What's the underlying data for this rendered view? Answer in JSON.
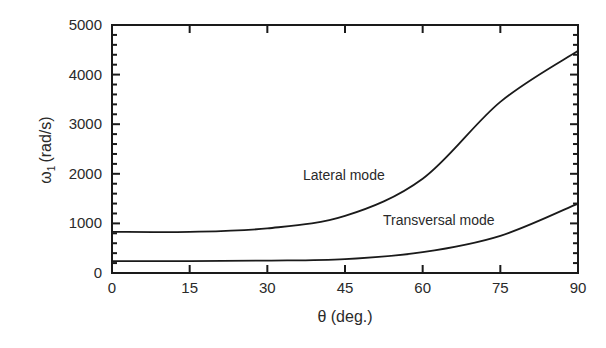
{
  "chart_data": {
    "type": "line",
    "title": "",
    "xlabel": "θ (deg.)",
    "ylabel": "ω1 (rad/s)",
    "xlim": [
      0,
      90
    ],
    "ylim": [
      0,
      5000
    ],
    "xticks": [
      0,
      15,
      30,
      45,
      60,
      75,
      90
    ],
    "yticks": [
      0,
      1000,
      2000,
      3000,
      4000,
      5000
    ],
    "grid": false,
    "legend": "none (inline annotations)",
    "x": [
      0,
      15,
      30,
      45,
      60,
      75,
      90
    ],
    "series": [
      {
        "name": "Lateral mode",
        "values": [
          830,
          830,
          900,
          1150,
          1900,
          3450,
          4480
        ]
      },
      {
        "name": "Transversal mode",
        "values": [
          240,
          240,
          250,
          280,
          420,
          750,
          1400
        ]
      }
    ],
    "annotations": [
      {
        "text": "Lateral mode",
        "x": 51,
        "y": 1920
      },
      {
        "text": "Transversal mode",
        "x": 74,
        "y": 1030
      }
    ]
  },
  "labels": {
    "x_axis": "θ (deg.)",
    "y_axis_main": "ω",
    "y_axis_sub": "1",
    "y_axis_unit": "(rad/s)",
    "lateral": "Lateral mode",
    "transversal": "Transversal mode"
  },
  "colors": {
    "line": "#1a1a1a",
    "axis": "#1a1a1a",
    "text": "#2a2a2a"
  }
}
